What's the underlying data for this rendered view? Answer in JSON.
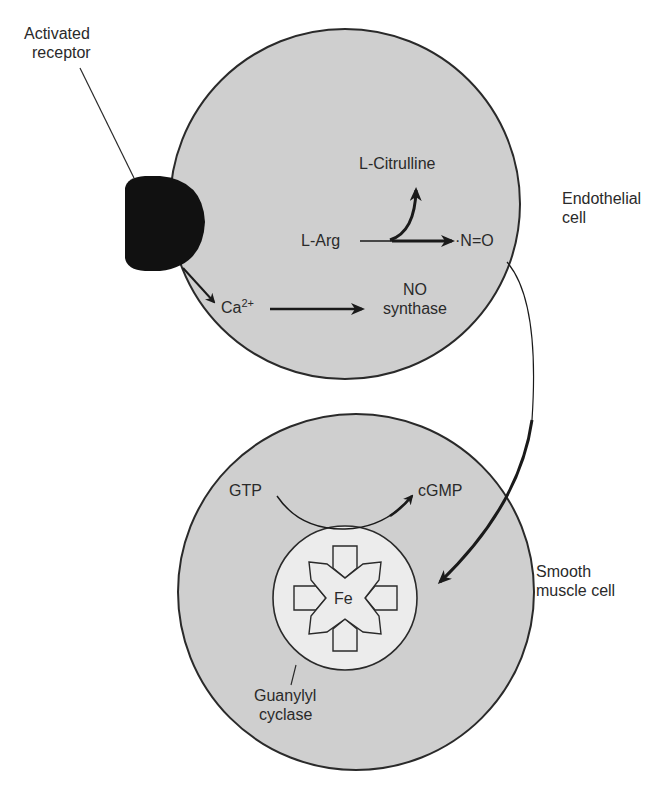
{
  "diagram": {
    "colors": {
      "cell_fill": "#cfcfcf",
      "cell_stroke": "#2a2a2a",
      "inner_fill": "#ececec",
      "receptor": "#111111",
      "background": "#ffffff"
    },
    "receptor": {
      "label_line1": "Activated",
      "label_line2": "receptor"
    },
    "endothelial_cell": {
      "label_line1": "Endothelial",
      "label_line2": "cell",
      "substrate": "L-Arg",
      "byproduct": "L-Citrulline",
      "product": "·N=O",
      "ion": "Ca",
      "ion_charge": "2+",
      "enzyme_line1": "NO",
      "enzyme_line2": "synthase"
    },
    "smooth_muscle_cell": {
      "label_line1": "Smooth",
      "label_line2": "muscle cell",
      "substrate": "GTP",
      "product": "cGMP",
      "metal_center": "Fe",
      "enzyme_line1": "Guanylyl",
      "enzyme_line2": "cyclase"
    }
  }
}
